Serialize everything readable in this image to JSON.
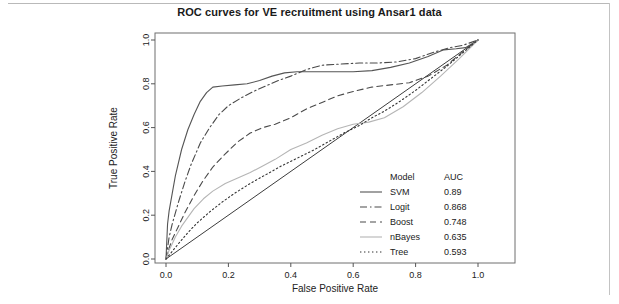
{
  "figure": {
    "title": "ROC curves for VE recruitment using Ansar1 data"
  },
  "chart_data": {
    "type": "line",
    "title": "ROC curves for VE recruitment using Ansar1 data",
    "xlabel": "False Positive Rate",
    "ylabel": "True Positive Rate",
    "xlim": [
      0,
      1
    ],
    "ylim": [
      0,
      1
    ],
    "grid": false,
    "legend_position": "bottom-right",
    "legend_columns": [
      "Model",
      "AUC"
    ],
    "reference_line": {
      "name": "chance-diagonal",
      "x": [
        0,
        1
      ],
      "y": [
        0,
        1
      ],
      "style": "solid",
      "color": "#3c3c3c"
    },
    "xticks": [
      0.0,
      0.2,
      0.4,
      0.6,
      0.8,
      1.0
    ],
    "xticklabels": [
      "0.0",
      "0.2",
      "0.4",
      "0.6",
      "0.8",
      "1.0"
    ],
    "yticks": [
      0.0,
      0.2,
      0.4,
      0.6,
      0.8,
      1.0
    ],
    "yticklabels": [
      "0.0",
      "0.2",
      "0.4",
      "0.6",
      "0.8",
      "1.0"
    ],
    "series": [
      {
        "name": "SVM",
        "auc": "0.89",
        "auc_value": 0.89,
        "style": "solid",
        "color": "#555555",
        "x": [
          0.0,
          0.005,
          0.01,
          0.02,
          0.03,
          0.05,
          0.07,
          0.09,
          0.11,
          0.13,
          0.15,
          0.18,
          0.22,
          0.26,
          0.3,
          0.34,
          0.38,
          0.42,
          0.46,
          0.5,
          0.55,
          0.6,
          0.66,
          0.72,
          0.78,
          0.84,
          0.89,
          0.93,
          0.96,
          1.0
        ],
        "y": [
          0.0,
          0.16,
          0.22,
          0.3,
          0.38,
          0.5,
          0.59,
          0.66,
          0.72,
          0.76,
          0.785,
          0.79,
          0.795,
          0.8,
          0.815,
          0.835,
          0.85,
          0.855,
          0.855,
          0.855,
          0.855,
          0.855,
          0.86,
          0.875,
          0.895,
          0.925,
          0.955,
          0.96,
          0.965,
          1.0
        ]
      },
      {
        "name": "Logit",
        "auc": "0.868",
        "auc_value": 0.868,
        "style": "dashdot",
        "color": "#4a4a4a",
        "x": [
          0.0,
          0.01,
          0.02,
          0.04,
          0.06,
          0.08,
          0.11,
          0.14,
          0.17,
          0.2,
          0.24,
          0.28,
          0.32,
          0.36,
          0.4,
          0.45,
          0.5,
          0.56,
          0.62,
          0.68,
          0.74,
          0.8,
          0.86,
          0.91,
          0.95,
          1.0
        ],
        "y": [
          0.0,
          0.1,
          0.16,
          0.26,
          0.35,
          0.43,
          0.53,
          0.6,
          0.66,
          0.7,
          0.735,
          0.765,
          0.79,
          0.815,
          0.835,
          0.865,
          0.885,
          0.89,
          0.895,
          0.895,
          0.9,
          0.915,
          0.945,
          0.965,
          0.975,
          1.0
        ]
      },
      {
        "name": "Boost",
        "auc": "0.748",
        "auc_value": 0.748,
        "style": "dashed",
        "color": "#4a4a4a",
        "x": [
          0.0,
          0.01,
          0.02,
          0.04,
          0.06,
          0.09,
          0.12,
          0.15,
          0.19,
          0.23,
          0.27,
          0.31,
          0.35,
          0.4,
          0.45,
          0.5,
          0.55,
          0.6,
          0.66,
          0.72,
          0.78,
          0.84,
          0.9,
          0.95,
          1.0
        ],
        "y": [
          0.0,
          0.05,
          0.09,
          0.15,
          0.21,
          0.29,
          0.36,
          0.42,
          0.48,
          0.535,
          0.575,
          0.6,
          0.615,
          0.645,
          0.685,
          0.715,
          0.745,
          0.765,
          0.785,
          0.795,
          0.805,
          0.835,
          0.885,
          0.945,
          1.0
        ]
      },
      {
        "name": "nBayes",
        "auc": "0.635",
        "auc_value": 0.635,
        "style": "solid",
        "color": "#b5b5b5",
        "x": [
          0.0,
          0.01,
          0.02,
          0.03,
          0.05,
          0.07,
          0.09,
          0.12,
          0.15,
          0.19,
          0.23,
          0.27,
          0.31,
          0.35,
          0.4,
          0.45,
          0.5,
          0.55,
          0.6,
          0.65,
          0.7,
          0.76,
          0.82,
          0.88,
          0.94,
          1.0
        ],
        "y": [
          0.0,
          0.04,
          0.07,
          0.1,
          0.15,
          0.19,
          0.23,
          0.275,
          0.31,
          0.345,
          0.37,
          0.395,
          0.425,
          0.455,
          0.5,
          0.53,
          0.565,
          0.595,
          0.615,
          0.625,
          0.645,
          0.695,
          0.76,
          0.835,
          0.915,
          1.0
        ]
      },
      {
        "name": "Tree",
        "auc": "0.593",
        "auc_value": 0.593,
        "style": "dotted",
        "color": "#333333",
        "x": [
          0.0,
          0.02,
          0.04,
          0.07,
          0.1,
          0.14,
          0.18,
          0.22,
          0.27,
          0.32,
          0.37,
          0.42,
          0.47,
          0.52,
          0.57,
          0.62,
          0.66,
          0.7,
          0.75,
          0.8,
          0.85,
          0.9,
          0.95,
          1.0
        ],
        "y": [
          0.0,
          0.035,
          0.07,
          0.12,
          0.165,
          0.215,
          0.26,
          0.3,
          0.345,
          0.385,
          0.425,
          0.46,
          0.495,
          0.535,
          0.575,
          0.61,
          0.645,
          0.675,
          0.72,
          0.77,
          0.825,
          0.88,
          0.94,
          1.0
        ]
      }
    ]
  }
}
